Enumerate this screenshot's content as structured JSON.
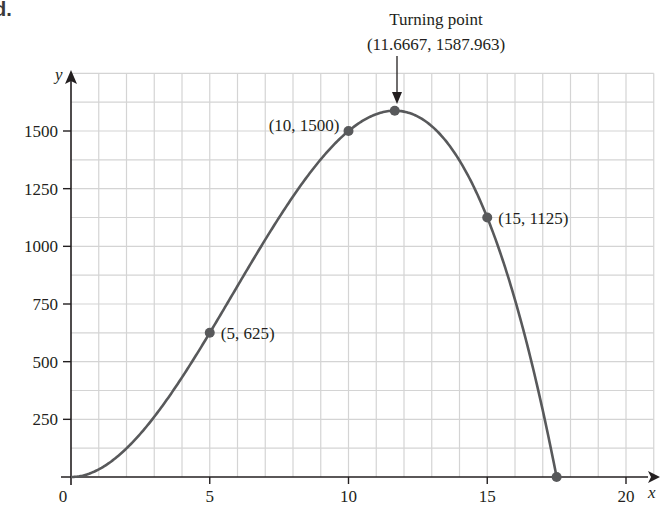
{
  "panel_label": "d.",
  "chart_data": {
    "type": "line",
    "title": "",
    "function": "y = 2x^2(17.5 - x)",
    "xlabel": "x",
    "ylabel": "y",
    "xlim": [
      0,
      21
    ],
    "ylim": [
      0,
      1750
    ],
    "x_ticks": [
      0,
      5,
      10,
      15,
      20
    ],
    "x_tick_labels": [
      "0",
      "5",
      "10",
      "15",
      "20"
    ],
    "y_ticks": [
      250,
      500,
      750,
      1000,
      1250,
      1500
    ],
    "y_tick_labels": [
      "250",
      "500",
      "750",
      "1000",
      "1250",
      "1500"
    ],
    "grid": true,
    "grid_minor_x_step": 1,
    "grid_minor_y_step": 125,
    "series": [
      {
        "name": "curve",
        "x": [
          0,
          1,
          2,
          3,
          4,
          5,
          6,
          7,
          8,
          9,
          10,
          11,
          11.6667,
          12,
          13,
          14,
          15,
          16,
          17,
          17.5
        ],
        "values": [
          0,
          33,
          124,
          261,
          432,
          625,
          828,
          1029,
          1216,
          1377,
          1500,
          1573,
          1587.963,
          1584,
          1521,
          1372,
          1125,
          768,
          289,
          0
        ]
      }
    ],
    "marked_points": [
      {
        "x": 5,
        "y": 625,
        "label": "(5, 625)"
      },
      {
        "x": 10,
        "y": 1500,
        "label": "(10, 1500)"
      },
      {
        "x": 11.6667,
        "y": 1587.963,
        "label": "(11.6667, 1587.963)"
      },
      {
        "x": 15,
        "y": 1125,
        "label": "(15, 1125)"
      },
      {
        "x": 17.5,
        "y": 0,
        "label": ""
      }
    ],
    "annotations": [
      {
        "text": "Turning point",
        "target": {
          "x": 11.6667,
          "y": 1587.963
        }
      },
      {
        "text": "(11.6667, 1587.963)",
        "target": {
          "x": 11.6667,
          "y": 1587.963
        }
      }
    ],
    "colors": {
      "curve": "#58595b",
      "points": "#58595b",
      "grid": "#d4d4d4",
      "axis": "#231f20"
    }
  }
}
